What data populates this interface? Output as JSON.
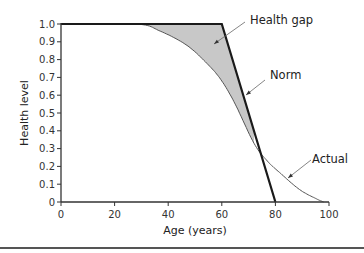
{
  "chart_data": {
    "type": "line",
    "title": "",
    "xlabel": "Age (years)",
    "ylabel": "Health level",
    "xlim": [
      0,
      100
    ],
    "ylim": [
      0,
      1.0
    ],
    "x_ticks": [
      "0",
      "20",
      "40",
      "60",
      "80",
      "100"
    ],
    "y_ticks": [
      "0",
      "0.1",
      "0.2",
      "0.3",
      "0.4",
      "0.5",
      "0.6",
      "0.7",
      "0.8",
      "0.9",
      "1.0"
    ],
    "grid": false,
    "legend": null,
    "series": [
      {
        "name": "Norm",
        "style": "thick black line",
        "x": [
          0,
          60,
          80
        ],
        "y": [
          1.0,
          1.0,
          0.0
        ]
      },
      {
        "name": "Actual",
        "style": "thin gray curve",
        "x": [
          0,
          28,
          37,
          47,
          55,
          60,
          65,
          72,
          77,
          82,
          89,
          95,
          98
        ],
        "y": [
          1.0,
          1.0,
          0.96,
          0.88,
          0.77,
          0.68,
          0.55,
          0.33,
          0.23,
          0.16,
          0.07,
          0.02,
          0.0
        ]
      }
    ],
    "shaded_region": {
      "name": "Health gap",
      "between": [
        "Norm",
        "Actual"
      ],
      "x_range": [
        28,
        72
      ],
      "color": "#c8c8c8"
    },
    "annotations": [
      {
        "text": "Health gap",
        "target": "shaded area"
      },
      {
        "text": "Norm",
        "target": "Norm line"
      },
      {
        "text": "Actual",
        "target": "Actual curve"
      }
    ]
  },
  "colors": {
    "norm_line": "#1a1a1a",
    "actual_line": "#555555",
    "gap_fill": "#c8c8c8",
    "axis": "#333333"
  }
}
